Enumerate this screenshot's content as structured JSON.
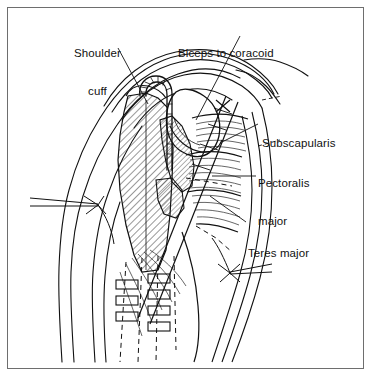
{
  "figure": {
    "background_color": "#ffffff",
    "ink_color": "#111111",
    "frame_color": "#6e6e6e",
    "width": 373,
    "height": 378
  },
  "labels": [
    {
      "id": "shoulder-cuff",
      "text_line1": "Shoulder",
      "text_line2": "cuff",
      "x": 74,
      "y": 22
    },
    {
      "id": "biceps-to-coracoid",
      "text_line1": "Biceps to coracoid",
      "text_line2": "",
      "x": 178,
      "y": 22
    },
    {
      "id": "subscapularis",
      "text_line1": "Subscapularis",
      "text_line2": "",
      "x": 262,
      "y": 112
    },
    {
      "id": "pectoralis-major",
      "text_line1": "Pectoralis",
      "text_line2": "major",
      "x": 258,
      "y": 152
    },
    {
      "id": "teres-major",
      "text_line1": "Teres major",
      "text_line2": "",
      "x": 248,
      "y": 222
    }
  ],
  "structures": {
    "bone_hatching": "diagonal-45",
    "muscle_fibers": "striated-parallel",
    "implant": "hook-shaped staple fixation",
    "sutures": "staple-rectangles-with-dashed-guides",
    "retractors": [
      "left-retractor",
      "right-retractor"
    ]
  }
}
